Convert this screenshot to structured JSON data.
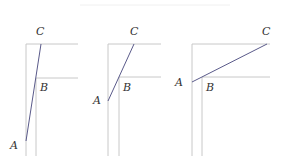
{
  "panels": [
    {
      "labels": {
        "A": "A",
        "B": "B",
        "C": "C"
      },
      "outer": {
        "x": 26,
        "y": 44,
        "right": 78,
        "bottom": 156
      },
      "inner": {
        "x": 36,
        "y": 78,
        "right": 78,
        "bottom": 156
      },
      "segment": {
        "A": [
          26,
          141
        ],
        "C": [
          41,
          44
        ]
      },
      "label_pos": {
        "A": [
          10,
          140
        ],
        "B": [
          40,
          82
        ],
        "C": [
          36,
          26
        ]
      }
    },
    {
      "labels": {
        "A": "A",
        "B": "B",
        "C": "C"
      },
      "outer": {
        "x": 108,
        "y": 44,
        "right": 161,
        "bottom": 156
      },
      "inner": {
        "x": 119,
        "y": 77,
        "right": 161,
        "bottom": 156
      },
      "segment": {
        "A": [
          108,
          101
        ],
        "C": [
          134,
          44
        ]
      },
      "label_pos": {
        "A": [
          93,
          95
        ],
        "B": [
          123,
          82
        ],
        "C": [
          130,
          26
        ]
      }
    },
    {
      "labels": {
        "A": "A",
        "B": "B",
        "C": "C"
      },
      "outer": {
        "x": 192,
        "y": 44,
        "right": 270,
        "bottom": 156
      },
      "inner": {
        "x": 202,
        "y": 77,
        "right": 270,
        "bottom": 156
      },
      "segment": {
        "A": [
          192,
          82
        ],
        "C": [
          267,
          44
        ]
      },
      "label_pos": {
        "A": [
          175,
          77
        ],
        "B": [
          206,
          82
        ],
        "C": [
          262,
          26
        ]
      }
    }
  ],
  "colors": {
    "guide": "#c8c8c8",
    "segment": "#5a5a8a",
    "label": "#333333"
  }
}
